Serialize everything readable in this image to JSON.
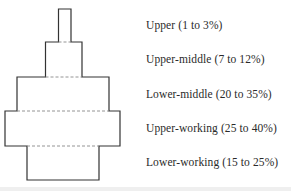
{
  "diagram": {
    "type": "class-pyramid",
    "tiers": [
      {
        "name": "Upper",
        "range": "1 to 3%",
        "label": "Upper (1 to 3%)"
      },
      {
        "name": "Upper-middle",
        "range": "7 to 12%",
        "label": "Upper-middle (7 to 12%)"
      },
      {
        "name": "Lower-middle",
        "range": "20 to 35%",
        "label": "Lower-middle (20 to 35%)"
      },
      {
        "name": "Upper-working",
        "range": "25 to 40%",
        "label": "Upper-working (25 to 40%)"
      },
      {
        "name": "Lower-working",
        "range": "15 to 25%",
        "label": "Lower-working (15 to 25%)"
      }
    ],
    "colors": {
      "stroke": "#333333",
      "dashed_divider": "#888888",
      "background": "#ffffff"
    }
  }
}
